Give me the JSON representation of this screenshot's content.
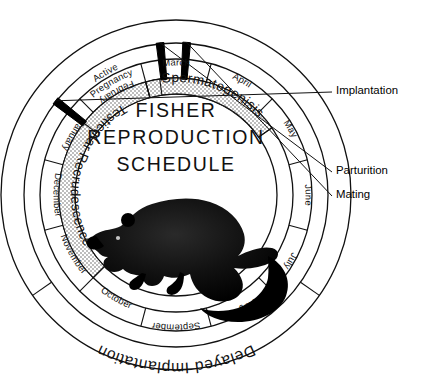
{
  "title": {
    "line1": "FISHER",
    "line2": "REPRODUCTION",
    "line3": "SCHEDULE"
  },
  "months": [
    {
      "label": "January",
      "start": -75,
      "end": -45
    },
    {
      "label": "February",
      "start": -45,
      "end": -15
    },
    {
      "label": "March",
      "start": -15,
      "end": 15
    },
    {
      "label": "April",
      "start": 15,
      "end": 45
    },
    {
      "label": "May",
      "start": 45,
      "end": 75
    },
    {
      "label": "June",
      "start": 75,
      "end": 105
    },
    {
      "label": "July",
      "start": 105,
      "end": 135
    },
    {
      "label": "August",
      "start": 135,
      "end": 165
    },
    {
      "label": "September",
      "start": 165,
      "end": 195
    },
    {
      "label": "October",
      "start": 195,
      "end": 225
    },
    {
      "label": "November",
      "start": 225,
      "end": 255
    },
    {
      "label": "December",
      "start": 255,
      "end": 285
    }
  ],
  "inner_phases": [
    {
      "label": "Testicular Recrudescence",
      "start": 225,
      "end": 345,
      "shaded": true
    },
    {
      "label": "Spermatogenisis",
      "start": 345,
      "end": 55,
      "shaded": true
    },
    {
      "label": "Active Pregnancy",
      "start": -52,
      "end": -8,
      "shaded": false
    }
  ],
  "outer_phases": [
    {
      "label": "Delayed Implantation",
      "start": 125,
      "end": 235,
      "shaded": false
    }
  ],
  "event_markers": [
    {
      "label": "Implantation",
      "angle": -52,
      "leader_y": 92
    },
    {
      "label": "Parturition",
      "angle": -6,
      "leader_y": 172
    },
    {
      "label": "Mating",
      "angle": 4,
      "leader_y": 196
    }
  ],
  "illustration": {
    "name": "fisher-animal-silhouette",
    "caption": "Fisher (Pekania pennanti) silhouette"
  },
  "colors": {
    "ink": "#111111",
    "paper": "#ffffff",
    "shaded_band": "#c9c9c9",
    "marker": "#000000"
  }
}
